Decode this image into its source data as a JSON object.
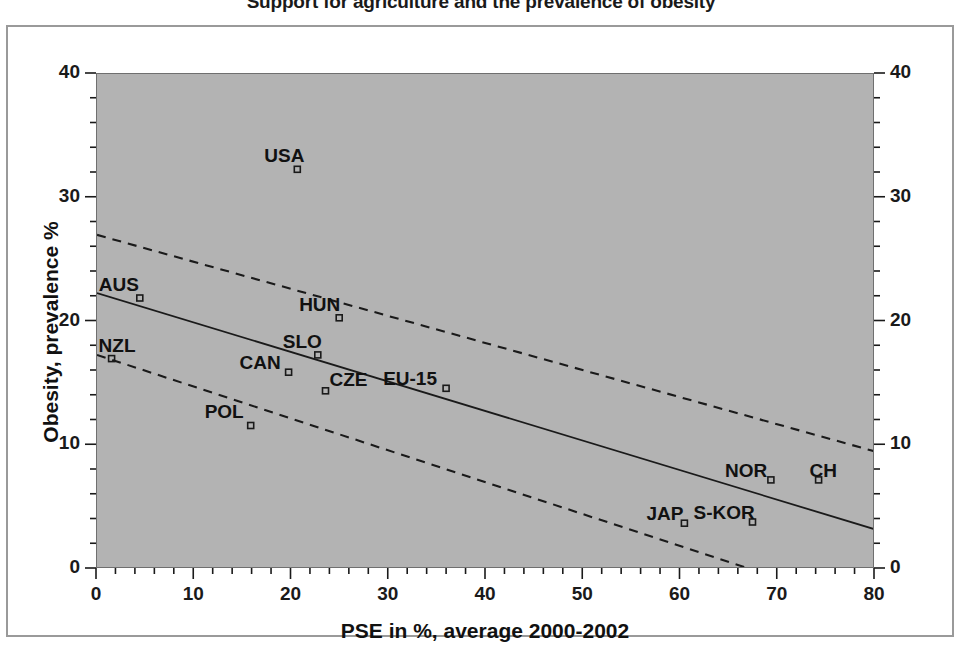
{
  "chart_data": {
    "type": "scatter",
    "title": "Support for agriculture and the prevalence of obesity",
    "xlabel": "PSE in %, average 2000-2002",
    "ylabel": "Obesity, prevalence %",
    "xlim": [
      0,
      80
    ],
    "ylim": [
      0,
      40
    ],
    "xticks": [
      "0",
      "10",
      "20",
      "30",
      "40",
      "50",
      "60",
      "70",
      "80"
    ],
    "xtick_values": [
      0,
      10,
      20,
      30,
      40,
      50,
      60,
      70,
      80
    ],
    "yticks": [
      "0",
      "10",
      "20",
      "30",
      "40"
    ],
    "ytick_values": [
      0,
      10,
      20,
      30,
      40
    ],
    "xminor_step": 2,
    "yminor_step": 2,
    "grid": false,
    "legend": "none",
    "dual_y_axis": true,
    "plot_background": "#b3b3b3",
    "marker_color": "#1a1a1a",
    "line_color": "#1a1a1a",
    "points": [
      {
        "label": "USA",
        "x": 20.6,
        "y": 32.3
      },
      {
        "label": "AUS",
        "x": 4.4,
        "y": 21.9
      },
      {
        "label": "HUN",
        "x": 24.9,
        "y": 20.3
      },
      {
        "label": "NZL",
        "x": 1.5,
        "y": 17.0
      },
      {
        "label": "SLO",
        "x": 22.7,
        "y": 17.3
      },
      {
        "label": "CAN",
        "x": 19.7,
        "y": 15.9
      },
      {
        "label": "CZE",
        "x": 23.5,
        "y": 14.4
      },
      {
        "label": "EU-15",
        "x": 35.9,
        "y": 14.6
      },
      {
        "label": "POL",
        "x": 15.8,
        "y": 11.6
      },
      {
        "label": "NOR",
        "x": 69.3,
        "y": 7.2
      },
      {
        "label": "CH",
        "x": 74.2,
        "y": 7.2
      },
      {
        "label": "JAP",
        "x": 60.4,
        "y": 3.7
      },
      {
        "label": "S-KOR",
        "x": 67.4,
        "y": 3.8
      }
    ],
    "fit_line": {
      "name": "regression line",
      "style": "solid",
      "x_start": 0,
      "y_start": 22.3,
      "x_end": 80,
      "y_end": 3.2
    },
    "confidence_bands": [
      {
        "name": "upper confidence band",
        "style": "dashed",
        "x_start": 0,
        "y_start": 27.0,
        "x_end": 80,
        "y_end": 9.5
      },
      {
        "name": "lower confidence band",
        "style": "dashed",
        "x_start": 0,
        "y_start": 17.3,
        "x_end": 80,
        "y_end": -3.3
      }
    ]
  },
  "labels": {
    "point_label_offsets": [
      {
        "label": "USA",
        "dx": -32,
        "dy": -22
      },
      {
        "label": "AUS",
        "dx": -40,
        "dy": -22
      },
      {
        "label": "HUN",
        "dx": -39,
        "dy": -22
      },
      {
        "label": "NZL",
        "dx": -12,
        "dy": -22
      },
      {
        "label": "SLO",
        "dx": -34,
        "dy": -22
      },
      {
        "label": "CAN",
        "dx": -48,
        "dy": -18
      },
      {
        "label": "CZE",
        "dx": 5,
        "dy": -20
      },
      {
        "label": "EU-15",
        "dx": -62,
        "dy": -18
      },
      {
        "label": "POL",
        "dx": -45,
        "dy": -22
      },
      {
        "label": "NOR",
        "dx": -45,
        "dy": -18
      },
      {
        "label": "CH",
        "dx": -8,
        "dy": -18
      },
      {
        "label": "JAP",
        "dx": -37,
        "dy": -18
      },
      {
        "label": "S-KOR",
        "dx": -58,
        "dy": -18
      }
    ]
  }
}
